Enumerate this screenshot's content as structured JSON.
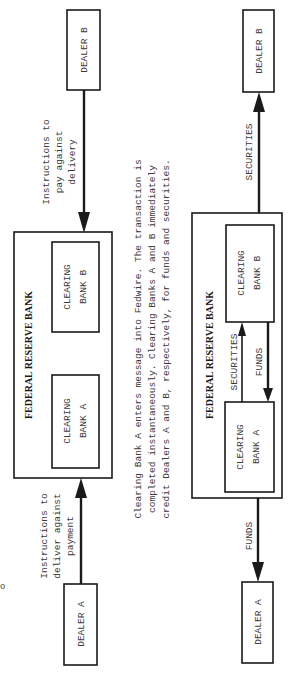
{
  "left_diagram": {
    "dealer_b": "DEALER B",
    "dealer_a": "DEALER A",
    "frb_title": "FEDERAL RESERVE BANK",
    "bank_b_line1": "CLEARING",
    "bank_b_line2": "BANK B",
    "bank_a_line1": "CLEARING",
    "bank_a_line2": "BANK A",
    "instr_b": [
      "Instructions to",
      "pay against",
      "delivery"
    ],
    "instr_a": [
      "Instructions to",
      "deliver against",
      "payment"
    ]
  },
  "caption": [
    "Clearing Bank A enters message into Fedwire. The transaction is",
    "completed instantaneously. Clearing Banks A and B immediately",
    "credit Dealers A and B, respectively, for funds and securities."
  ],
  "right_diagram": {
    "dealer_b": "DEALER B",
    "dealer_a": "DEALER A",
    "frb_title": "FEDERAL RESERVE BANK",
    "bank_b_line1": "CLEARING",
    "bank_b_line2": "BANK B",
    "bank_a_line1": "CLEARING",
    "bank_a_line2": "BANK A",
    "securities_label": "SECURITIES",
    "funds_label": "FUNDS",
    "securities_out_label": "SECURITIES",
    "funds_out_label": "FUNDS"
  },
  "margin_mark": "o"
}
